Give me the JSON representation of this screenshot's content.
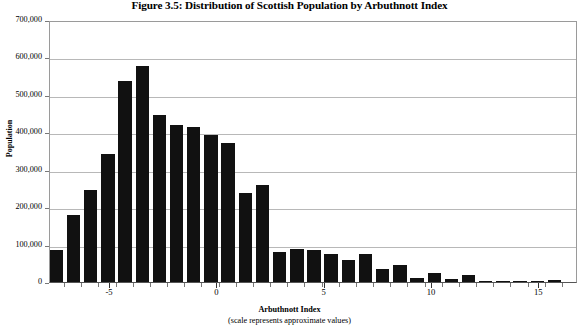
{
  "chart_data": {
    "type": "bar",
    "title": "Figure 3.5: Distribution of Scottish Population by Arbuthnott Index",
    "xlabel": "Arbuthnott Index",
    "xlabel_sub": "(scale represents approximate values)",
    "ylabel": "Population",
    "ylim": [
      0,
      700000
    ],
    "ytick_labels": [
      "700,000",
      "600,000",
      "500,000",
      "400,000",
      "300,000",
      "200,000",
      "100,000",
      "0"
    ],
    "ytick_values": [
      700000,
      600000,
      500000,
      400000,
      300000,
      200000,
      100000,
      0
    ],
    "xlim": [
      -7.8,
      16.8
    ],
    "xtick_labels": [
      "-5",
      "0",
      "5",
      "10",
      "15"
    ],
    "xtick_values": [
      -5,
      0,
      5,
      10,
      15
    ],
    "grid": "horizontal",
    "legend": "none",
    "bar_color": "#111111",
    "categories": [
      -7.5,
      -6.7,
      -5.9,
      -5.1,
      -4.3,
      -3.5,
      -2.7,
      -1.9,
      -1.1,
      -0.3,
      0.5,
      1.3,
      2.1,
      2.9,
      3.7,
      4.5,
      5.3,
      6.1,
      6.9,
      7.7,
      8.5,
      9.3,
      10.1,
      10.9,
      11.7,
      12.5,
      13.3,
      14.1,
      14.9,
      15.7
    ],
    "values": [
      85000,
      180000,
      245000,
      342000,
      538000,
      578000,
      445000,
      420000,
      415000,
      392000,
      372000,
      237000,
      258000,
      80000,
      88000,
      85000,
      75000,
      60000,
      75000,
      35000,
      45000,
      12000,
      25000,
      8000,
      18000,
      2000,
      3000,
      2000,
      1000,
      5000
    ]
  }
}
